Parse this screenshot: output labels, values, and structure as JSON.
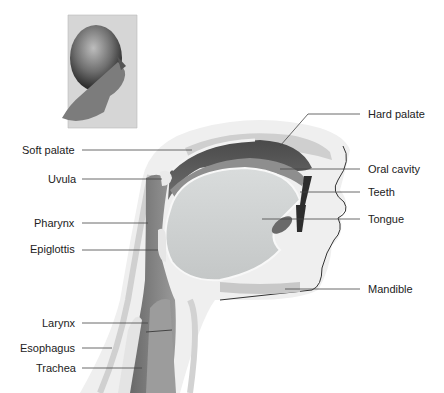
{
  "diagram": {
    "labels_left": [
      {
        "id": "soft-palate",
        "text": "Soft palate",
        "x": 22,
        "y": 144,
        "line": [
          82,
          150,
          192,
          150
        ]
      },
      {
        "id": "uvula",
        "text": "Uvula",
        "x": 48,
        "y": 173,
        "line": [
          82,
          179,
          162,
          179
        ]
      },
      {
        "id": "pharynx",
        "text": "Pharynx",
        "x": 34,
        "y": 217,
        "line": [
          82,
          223,
          148,
          223
        ]
      },
      {
        "id": "epiglottis",
        "text": "Epiglottis",
        "x": 30,
        "y": 243,
        "line": [
          82,
          250,
          158,
          250
        ]
      },
      {
        "id": "larynx",
        "text": "Larynx",
        "x": 42,
        "y": 317,
        "line": [
          82,
          323,
          148,
          323
        ]
      },
      {
        "id": "esophagus",
        "text": "Esophagus",
        "x": 20,
        "y": 342,
        "line": [
          82,
          348,
          112,
          348
        ]
      },
      {
        "id": "trachea",
        "text": "Trachea",
        "x": 36,
        "y": 362,
        "line": [
          82,
          368,
          142,
          368
        ]
      }
    ],
    "labels_right": [
      {
        "id": "hard-palate",
        "text": "Hard palate",
        "x": 368,
        "y": 108,
        "line": [
          360,
          114,
          308,
          114,
          280,
          146
        ]
      },
      {
        "id": "oral-cavity",
        "text": "Oral cavity",
        "x": 368,
        "y": 163,
        "line": [
          360,
          169,
          280,
          169
        ]
      },
      {
        "id": "teeth",
        "text": "Teeth",
        "x": 368,
        "y": 186,
        "line": [
          360,
          192,
          300,
          192
        ]
      },
      {
        "id": "tongue",
        "text": "Tongue",
        "x": 368,
        "y": 213,
        "line": [
          360,
          219,
          262,
          219
        ]
      },
      {
        "id": "mandible",
        "text": "Mandible",
        "x": 368,
        "y": 283,
        "line": [
          360,
          289,
          285,
          289
        ]
      }
    ],
    "inset": {
      "description": "Profile photo of a man's head (right-facing)"
    },
    "colors": {
      "label_text": "#222222",
      "leader_line": "#444444",
      "tissue_light": "#e2e2e2",
      "tissue_mid": "#a8a8a8",
      "tissue_dark": "#5a5a5a",
      "outline": "#333333"
    }
  }
}
